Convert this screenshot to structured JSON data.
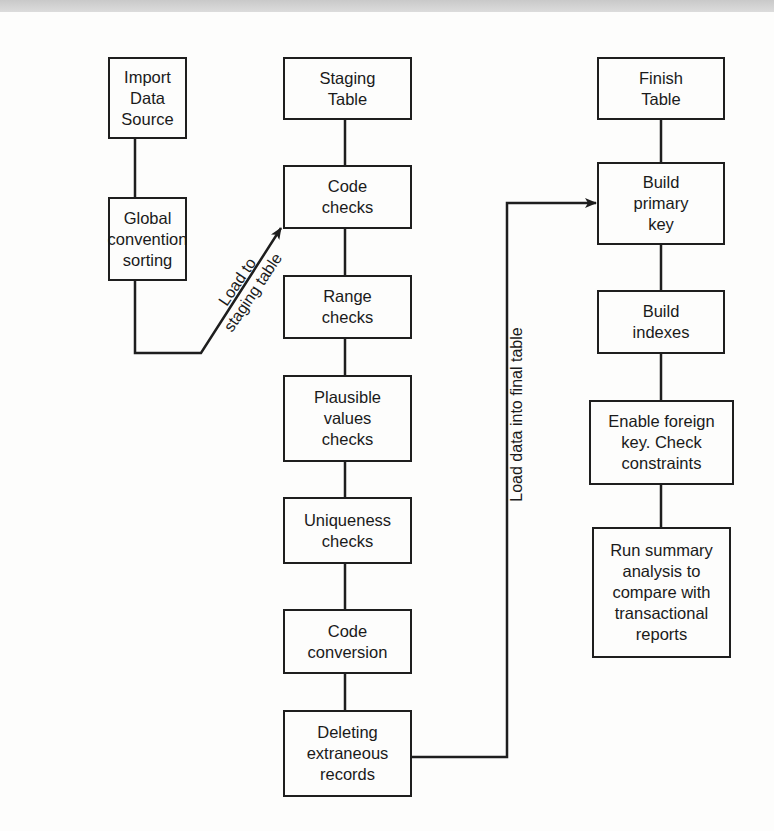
{
  "diagram": {
    "type": "flowchart",
    "columns": [
      {
        "id": "source",
        "nodes": [
          {
            "id": "import",
            "label": "Import\nData\nSource"
          },
          {
            "id": "global_sort",
            "label": "Global\nconvention\nsorting"
          }
        ]
      },
      {
        "id": "staging",
        "nodes": [
          {
            "id": "staging_table",
            "label": "Staging\nTable"
          },
          {
            "id": "code_checks",
            "label": "Code\nchecks"
          },
          {
            "id": "range_checks",
            "label": "Range\nchecks"
          },
          {
            "id": "plausible",
            "label": "Plausible\nvalues\nchecks"
          },
          {
            "id": "uniqueness",
            "label": "Uniqueness\nchecks"
          },
          {
            "id": "code_conversion",
            "label": "Code\nconversion"
          },
          {
            "id": "deleting",
            "label": "Deleting\nextraneous\nrecords"
          }
        ]
      },
      {
        "id": "finish",
        "nodes": [
          {
            "id": "finish_table",
            "label": "Finish\nTable"
          },
          {
            "id": "primary_key",
            "label": "Build\nprimary\nkey"
          },
          {
            "id": "indexes",
            "label": "Build\nindexes"
          },
          {
            "id": "foreign_key",
            "label": "Enable foreign\nkey. Check\nconstraints"
          },
          {
            "id": "summary",
            "label": "Run summary\nanalysis to\ncompare with\ntransactional\nreports"
          }
        ]
      }
    ],
    "edges": [
      {
        "from": "global_sort",
        "to": "code_checks",
        "label": "Load to\nstaging table",
        "arrow": true
      },
      {
        "from": "deleting",
        "to": "primary_key",
        "label": "Load data into final table",
        "arrow": true
      }
    ],
    "colors": {
      "stroke": "#1e1e1e",
      "background": "#fdfdfc"
    }
  }
}
